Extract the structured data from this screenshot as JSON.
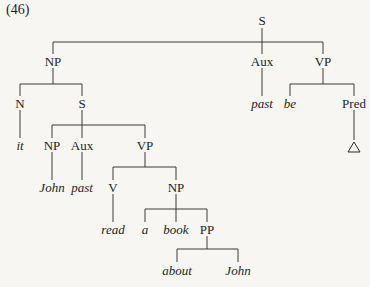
{
  "example_number": "(46)",
  "nodes": {
    "s_root": {
      "label": "S",
      "x": 262,
      "y": 20
    },
    "np1": {
      "label": "NP",
      "x": 53,
      "y": 61
    },
    "aux_root": {
      "label": "Aux",
      "x": 262,
      "y": 61
    },
    "vp_root": {
      "label": "VP",
      "x": 323,
      "y": 61
    },
    "n": {
      "label": "N",
      "x": 20,
      "y": 103
    },
    "s_emb": {
      "label": "S",
      "x": 82,
      "y": 103
    },
    "past1": {
      "label": "past",
      "x": 262,
      "y": 103
    },
    "be": {
      "label": "be",
      "x": 290,
      "y": 103
    },
    "pred": {
      "label": "Pred",
      "x": 354,
      "y": 103
    },
    "it": {
      "label": "it",
      "x": 20,
      "y": 145
    },
    "np2": {
      "label": "NP",
      "x": 52,
      "y": 145
    },
    "aux2": {
      "label": "Aux",
      "x": 82,
      "y": 145
    },
    "vp2": {
      "label": "VP",
      "x": 145,
      "y": 145
    },
    "john1": {
      "label": "John",
      "x": 52,
      "y": 187
    },
    "past2": {
      "label": "past",
      "x": 82,
      "y": 187
    },
    "v": {
      "label": "V",
      "x": 113,
      "y": 187
    },
    "np3": {
      "label": "NP",
      "x": 176,
      "y": 187
    },
    "read": {
      "label": "read",
      "x": 113,
      "y": 229
    },
    "a": {
      "label": "a",
      "x": 145,
      "y": 229
    },
    "book": {
      "label": "book",
      "x": 176,
      "y": 229
    },
    "pp": {
      "label": "PP",
      "x": 207,
      "y": 229
    },
    "about": {
      "label": "about",
      "x": 177,
      "y": 270
    },
    "john2": {
      "label": "John",
      "x": 238,
      "y": 270
    }
  },
  "triangle": {
    "symbol": "△",
    "x": 354,
    "y": 147
  }
}
